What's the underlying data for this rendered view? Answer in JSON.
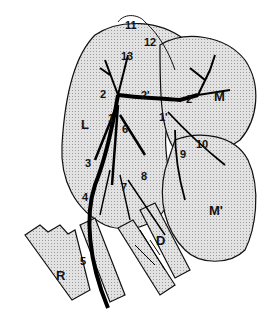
{
  "figure": {
    "type": "anatomical vascular diagram",
    "colors": {
      "organ_fill": "#d6d6d6",
      "outline": "#111111",
      "vessel": "#000000",
      "background": "#ffffff"
    }
  },
  "labels": [
    {
      "id": "11",
      "text": "11",
      "x": 129,
      "y": 26
    },
    {
      "id": "12",
      "text": "12",
      "x": 148,
      "y": 43
    },
    {
      "id": "13",
      "text": "13",
      "x": 125,
      "y": 57
    },
    {
      "id": "2a",
      "text": "2",
      "x": 104,
      "y": 95
    },
    {
      "id": "2prime",
      "text": "2'",
      "x": 145,
      "y": 96
    },
    {
      "id": "2b",
      "text": "2",
      "x": 190,
      "y": 100
    },
    {
      "id": "M",
      "text": "M",
      "x": 218,
      "y": 96
    },
    {
      "id": "L",
      "text": "L",
      "x": 85,
      "y": 124
    },
    {
      "id": "1",
      "text": "1",
      "x": 112,
      "y": 119
    },
    {
      "id": "1prime",
      "text": "1'",
      "x": 163,
      "y": 118
    },
    {
      "id": "6",
      "text": "6",
      "x": 126,
      "y": 130
    },
    {
      "id": "10",
      "text": "10",
      "x": 200,
      "y": 145
    },
    {
      "id": "9",
      "text": "9",
      "x": 184,
      "y": 155
    },
    {
      "id": "3",
      "text": "3",
      "x": 89,
      "y": 164
    },
    {
      "id": "8",
      "text": "8",
      "x": 145,
      "y": 177
    },
    {
      "id": "7",
      "text": "7",
      "x": 125,
      "y": 188
    },
    {
      "id": "4",
      "text": "4",
      "x": 86,
      "y": 198
    },
    {
      "id": "Mprime",
      "text": "M'",
      "x": 213,
      "y": 210
    },
    {
      "id": "D",
      "text": "D",
      "x": 160,
      "y": 240
    },
    {
      "id": "R",
      "text": "R",
      "x": 60,
      "y": 275
    },
    {
      "id": "5",
      "text": "5",
      "x": 84,
      "y": 262
    }
  ]
}
